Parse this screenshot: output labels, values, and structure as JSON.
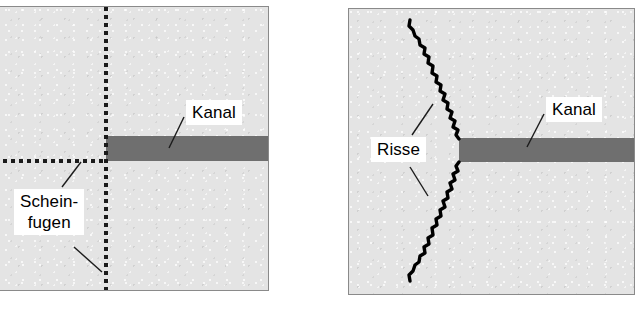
{
  "figure": {
    "type": "technical-diagram",
    "colors": {
      "slab_fill": "#e4e4e4",
      "channel_fill": "#6f6f6f",
      "panel_border": "#8a8a8a",
      "joint_line": "#1b1b1b",
      "crack_line": "#000000",
      "label_background": "#ffffff",
      "label_text": "#000000"
    }
  },
  "panels": [
    {
      "id": "left",
      "name": "slab-with-dummy-joints",
      "labels": [
        {
          "id": "kanal",
          "text": "Kanal"
        },
        {
          "id": "scheinfugen",
          "line1": "Schein-",
          "line2": "fugen"
        }
      ],
      "features": [
        {
          "name": "channel-band",
          "label": "Kanal"
        },
        {
          "name": "vertical-dummy-joint",
          "label": "Scheinfugen"
        },
        {
          "name": "horizontal-dummy-joint",
          "label": "Scheinfugen"
        }
      ]
    },
    {
      "id": "right",
      "name": "slab-with-cracks",
      "labels": [
        {
          "id": "kanal",
          "text": "Kanal"
        },
        {
          "id": "risse",
          "text": "Risse"
        }
      ],
      "features": [
        {
          "name": "channel-band",
          "label": "Kanal"
        },
        {
          "name": "upper-crack",
          "label": "Risse"
        },
        {
          "name": "lower-crack",
          "label": "Risse"
        }
      ]
    }
  ]
}
